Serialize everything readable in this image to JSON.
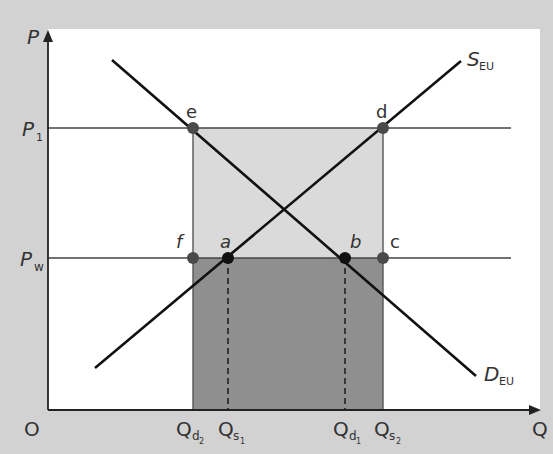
{
  "diagram": {
    "type": "supply-demand-tariff",
    "axes": {
      "y_label": "P",
      "x_label": "Q",
      "origin_label": "O"
    },
    "price_levels": [
      {
        "id": "p1",
        "label": "P",
        "sub": "1"
      },
      {
        "id": "pw",
        "label": "P",
        "sub": "w"
      }
    ],
    "quantities": [
      {
        "id": "qd2",
        "label": "Q",
        "sub": "d",
        "subsub": "2"
      },
      {
        "id": "qs1",
        "label": "Q",
        "sub": "s",
        "subsub": "1"
      },
      {
        "id": "qd1",
        "label": "Q",
        "sub": "d",
        "subsub": "1"
      },
      {
        "id": "qs2",
        "label": "Q",
        "sub": "s",
        "subsub": "2"
      }
    ],
    "curves": [
      {
        "id": "supply",
        "label": "S",
        "sub": "EU"
      },
      {
        "id": "demand",
        "label": "D",
        "sub": "EU"
      }
    ],
    "points": {
      "e": "e",
      "d": "d",
      "f": "f",
      "a": "a",
      "b": "b",
      "c": "c"
    },
    "colors": {
      "background": "#d2d2d2",
      "panel": "#ffffff",
      "light_area": "#d9d9d9",
      "dark_area": "#8f8f8f",
      "line": "#111111",
      "dot_gray": "#4a4a4a",
      "dot_black": "#111111"
    }
  }
}
